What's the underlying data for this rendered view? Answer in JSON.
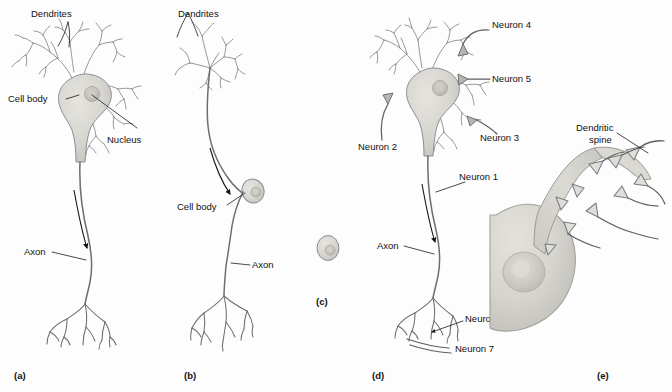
{
  "figure": {
    "background_color": "#fdfdfd",
    "ink_color": "#6e6e72",
    "text_color": "#111111",
    "soma_fill": "#d9d7d2",
    "soma_fill_dark": "#c6c4bf",
    "nucleus_fill": "#c2c0bb"
  },
  "panels": [
    {
      "key": "a",
      "label": "(a)",
      "name": "multipolar-neuron",
      "callouts": [
        {
          "id": "dendrites",
          "text": "Dendrites"
        },
        {
          "id": "cell_body",
          "text": "Cell body"
        },
        {
          "id": "nucleus",
          "text": "Nucleus"
        },
        {
          "id": "axon",
          "text": "Axon"
        }
      ]
    },
    {
      "key": "b",
      "label": "(b)",
      "name": "unipolar-neuron",
      "callouts": [
        {
          "id": "dendrites",
          "text": "Dendrites"
        },
        {
          "id": "cell_body",
          "text": "Cell body"
        },
        {
          "id": "axon",
          "text": "Axon"
        }
      ]
    },
    {
      "key": "c",
      "label": "(c)",
      "name": "isolated-cell-body",
      "callouts": []
    },
    {
      "key": "d",
      "label": "(d)",
      "name": "neuron-synaptic-connections",
      "callouts": [
        {
          "id": "neuron4",
          "text": "Neuron 4"
        },
        {
          "id": "neuron5",
          "text": "Neuron 5"
        },
        {
          "id": "neuron3",
          "text": "Neuron 3"
        },
        {
          "id": "neuron2",
          "text": "Neuron 2"
        },
        {
          "id": "neuron1",
          "text": "Neuron 1"
        },
        {
          "id": "axon",
          "text": "Axon"
        },
        {
          "id": "neuron6",
          "text": "Neuron 6"
        },
        {
          "id": "neuron7",
          "text": "Neuron 7"
        }
      ]
    },
    {
      "key": "e",
      "label": "(e)",
      "name": "dendritic-spine-closeup",
      "callouts": [
        {
          "id": "dendritic_spine_line1",
          "text": "Dendritic"
        },
        {
          "id": "dendritic_spine_line2",
          "text": "spine"
        }
      ]
    }
  ]
}
